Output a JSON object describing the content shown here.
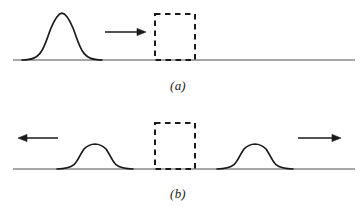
{
  "figure": {
    "title": "",
    "background_color": "#ffffff",
    "line_color": "#1a1a1a",
    "baseline_color": "#808080",
    "width": 361,
    "height": 213
  },
  "panels": [
    {
      "id": "a",
      "caption": "(a)",
      "baseline": {
        "y": 60,
        "x_start": 13,
        "x_end": 355
      },
      "pulses": [
        {
          "name": "incident-pulse",
          "shape": "gaussian",
          "center_x": 62,
          "amplitude": 47,
          "half_width": 36,
          "direction": "right"
        }
      ],
      "arrows": [
        {
          "name": "incident-direction-arrow",
          "direction": "right",
          "x_start": 105,
          "x_end": 146,
          "y": 32
        }
      ],
      "dashed_box": {
        "name": "boundary-region",
        "x": 155,
        "y": 14,
        "width": 40,
        "height": 46,
        "style": "dashed"
      }
    },
    {
      "id": "b",
      "caption": "(b)",
      "baseline": {
        "y": 169,
        "x_start": 13,
        "x_end": 355
      },
      "pulses": [
        {
          "name": "reflected-pulse",
          "shape": "gaussian",
          "center_x": 95,
          "amplitude": 24,
          "half_width": 36,
          "direction": "left"
        },
        {
          "name": "transmitted-pulse",
          "shape": "gaussian",
          "center_x": 255,
          "amplitude": 24,
          "half_width": 36,
          "direction": "right"
        }
      ],
      "arrows": [
        {
          "name": "reflected-direction-arrow",
          "direction": "left",
          "x_start": 58,
          "x_end": 18,
          "y": 138
        },
        {
          "name": "transmitted-direction-arrow",
          "direction": "right",
          "x_start": 298,
          "x_end": 341,
          "y": 138
        }
      ],
      "dashed_box": {
        "name": "boundary-region",
        "x": 155,
        "y": 123,
        "width": 40,
        "height": 46,
        "style": "dashed"
      }
    }
  ]
}
